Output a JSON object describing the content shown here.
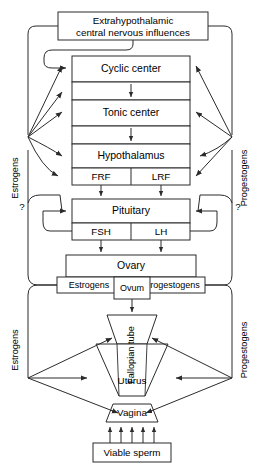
{
  "diagram": {
    "title_box": {
      "line1": "Extrahypothalamic",
      "line2": "central nervous influences"
    },
    "brain": {
      "cyclic_center": "Cyclic center",
      "tonic_center": "Tonic center",
      "hypothalamus": "Hypothalamus",
      "frf": "FRF",
      "lrf": "LRF"
    },
    "pituitary": {
      "name": "Pituitary",
      "fsh": "FSH",
      "lh": "LH"
    },
    "ovary": {
      "name": "Ovary",
      "estrogens": "Estrogens",
      "ovum": "Ovum",
      "progestogens": "Progestogens"
    },
    "tract": {
      "fallopian_tube": "Fallopian tube",
      "uterus": "Uterus",
      "vagina": "Vagina"
    },
    "sperm_box": "Viable sperm",
    "feedback_left": {
      "upper_label": "Estrogens",
      "lower_label": "Estrogens",
      "query": "?"
    },
    "feedback_right": {
      "upper_label": "Progestogens",
      "lower_label": "Progestogens",
      "query": "?"
    },
    "colors": {
      "stroke": "#2b2b2b",
      "fill": "#ffffff",
      "text": "#000000"
    }
  }
}
